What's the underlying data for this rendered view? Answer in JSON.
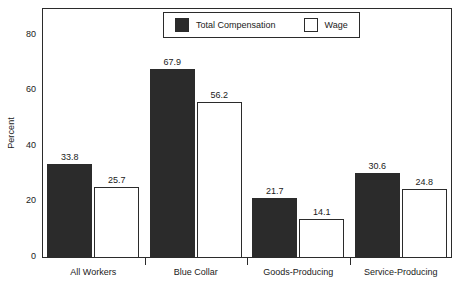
{
  "chart_data": {
    "type": "bar",
    "title": "",
    "xlabel": "",
    "ylabel": "Percent",
    "ylim": [
      0,
      90
    ],
    "yticks": [
      0,
      20,
      40,
      60,
      80
    ],
    "grid": false,
    "legend_position": "top-center",
    "categories": [
      "All Workers",
      "Blue Collar",
      "Goods-Producing",
      "Service-Producing"
    ],
    "series": [
      {
        "name": "Total Compensation",
        "color": "#2b2b2b",
        "style": "filled",
        "values": [
          33.8,
          67.9,
          21.7,
          30.6
        ]
      },
      {
        "name": "Wage",
        "color": "#ffffff",
        "style": "hollow",
        "values": [
          25.7,
          56.2,
          14.1,
          24.8
        ]
      }
    ],
    "value_labels": [
      [
        "33.8",
        "25.7"
      ],
      [
        "67.9",
        "56.2"
      ],
      [
        "21.7",
        "14.1"
      ],
      [
        "30.6",
        "24.8"
      ]
    ],
    "ytick_labels": [
      "0",
      "20",
      "40",
      "60",
      "80"
    ]
  },
  "legend": {
    "entries": [
      {
        "label": "Total Compensation",
        "swatch": "filled-square-icon"
      },
      {
        "label": "Wage",
        "swatch": "hollow-square-icon"
      }
    ]
  },
  "axes": {
    "y_title": "Percent"
  }
}
